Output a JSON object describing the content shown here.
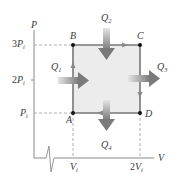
{
  "diagram": {
    "type": "PV diagram",
    "axes": {
      "y_label": "P",
      "x_label": "V",
      "y_ticks": [
        {
          "coef": "3",
          "var": "P",
          "sub": "i"
        },
        {
          "coef": "2",
          "var": "P",
          "sub": "i"
        },
        {
          "coef": "",
          "var": "P",
          "sub": "i"
        }
      ],
      "x_ticks": [
        {
          "coef": "",
          "var": "V",
          "sub": "i"
        },
        {
          "coef": "2",
          "var": "V",
          "sub": "i"
        }
      ]
    },
    "points": [
      {
        "name": "A",
        "label": "A"
      },
      {
        "name": "B",
        "label": "B"
      },
      {
        "name": "C",
        "label": "C"
      },
      {
        "name": "D",
        "label": "D"
      }
    ],
    "heat_transfers": [
      {
        "var": "Q",
        "sub": "1",
        "direction": "in",
        "path": "A→B"
      },
      {
        "var": "Q",
        "sub": "2",
        "direction": "in",
        "path": "B→C"
      },
      {
        "var": "Q",
        "sub": "3",
        "direction": "out",
        "path": "C→D"
      },
      {
        "var": "Q",
        "sub": "4",
        "direction": "out",
        "path": "D→A"
      }
    ],
    "colors": {
      "cycle_line": "#777777",
      "cycle_fill": "#ececec",
      "axis": "#888888",
      "dashed": "#999999",
      "arrow_dark": "#7a7a7a",
      "arrow_light": "#e0e0e0",
      "point": "#111111"
    }
  }
}
